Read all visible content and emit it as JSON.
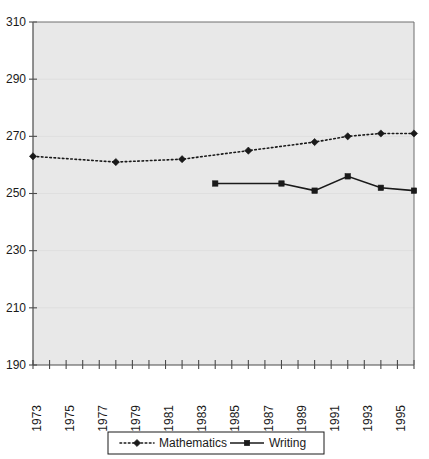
{
  "chart_data": {
    "type": "line",
    "title": "",
    "subtitle": "",
    "xlabel": "",
    "ylabel": "",
    "xlim": [
      1973,
      1996
    ],
    "ylim": [
      190,
      310
    ],
    "y_ticks": [
      310,
      290,
      270,
      250,
      230,
      210,
      190
    ],
    "x_ticks": [
      1973,
      1974,
      1975,
      1976,
      1977,
      1978,
      1979,
      1980,
      1981,
      1982,
      1983,
      1984,
      1985,
      1986,
      1987,
      1988,
      1989,
      1990,
      1991,
      1992,
      1993,
      1994,
      1995,
      1996
    ],
    "x_tick_labels": [
      "1973",
      "",
      "1975",
      "",
      "1977",
      "",
      "1979",
      "",
      "1981",
      "",
      "1983",
      "",
      "1985",
      "",
      "1987",
      "",
      "1989",
      "",
      "1991",
      "",
      "1993",
      "",
      "1995",
      ""
    ],
    "grid": "horizontal-faint",
    "legend_position": "bottom",
    "series": [
      {
        "name": "Mathematics",
        "marker": "diamond",
        "line_style": "dotted",
        "color": "#1a1a1a",
        "x": [
          1973,
          1978,
          1982,
          1986,
          1990,
          1992,
          1994,
          1996
        ],
        "values": [
          263,
          261,
          262,
          265,
          268,
          270,
          271,
          271
        ]
      },
      {
        "name": "Writing",
        "marker": "square",
        "line_style": "solid",
        "color": "#1a1a1a",
        "x": [
          1984,
          1988,
          1990,
          1992,
          1994,
          1996
        ],
        "values": [
          253.5,
          253.5,
          251,
          256,
          252,
          251
        ]
      }
    ],
    "legend_entries": [
      {
        "label": "Mathematics",
        "marker": "diamond",
        "line_style": "dotted"
      },
      {
        "label": "Writing",
        "marker": "square",
        "line_style": "solid"
      }
    ],
    "colors": {
      "plot_background": "#e8e8e8",
      "page_background": "#ffffff",
      "axis": "#4a4a4a",
      "ink": "#1a1a1a"
    }
  }
}
